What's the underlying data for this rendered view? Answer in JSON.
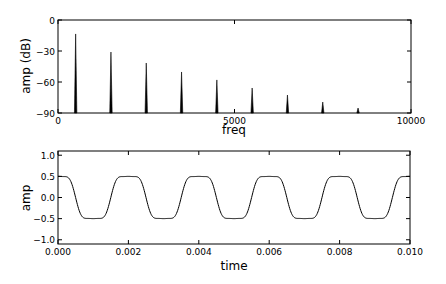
{
  "chart_data": [
    {
      "type": "bar",
      "subtype": "spectrum-stems",
      "title": "",
      "xlabel": "freq",
      "ylabel": "amp (dB)",
      "xlim": [
        0,
        10000
      ],
      "ylim": [
        -90,
        0
      ],
      "xticks": [
        0,
        5000,
        10000
      ],
      "xtick_labels": [
        "0",
        "5000",
        "10000"
      ],
      "yticks": [
        0,
        -30,
        -60,
        -90
      ],
      "ytick_labels": [
        "0",
        "−30",
        "−60",
        "−90"
      ],
      "grid": false,
      "legend": null,
      "x": [
        500,
        1500,
        2500,
        3500,
        4500,
        5500,
        6500,
        7500,
        8500
      ],
      "values": [
        -13.5,
        -31,
        -41.6,
        -50.3,
        -58,
        -65.8,
        -72.6,
        -79.4,
        -85.2
      ],
      "line_color": "#000000"
    },
    {
      "type": "line",
      "title": "",
      "xlabel": "time",
      "ylabel": "amp",
      "xlim": [
        0,
        0.01
      ],
      "ylim": [
        -1.1,
        1.1
      ],
      "xticks": [
        0,
        0.002,
        0.004,
        0.006,
        0.008,
        0.01
      ],
      "xtick_labels": [
        "0.000",
        "0.002",
        "0.004",
        "0.006",
        "0.008",
        "0.010"
      ],
      "yticks": [
        1.0,
        0.5,
        0.0,
        -0.5,
        -1.0
      ],
      "ytick_labels": [
        "1.0",
        "0.5",
        "0.0",
        "−0.5",
        "−1.0"
      ],
      "grid": false,
      "legend": null,
      "series": [
        {
          "name": "waveform",
          "description": "500 Hz smoothed square-like wave, amplitude ~0.5, peak at t=0",
          "frequency_hz": 500,
          "amplitude": 0.5,
          "x": [
            0,
            0.0005,
            0.001,
            0.0015,
            0.002,
            0.0025,
            0.003,
            0.0035,
            0.004,
            0.0045,
            0.005,
            0.0055,
            0.006,
            0.0065,
            0.007,
            0.0075,
            0.008,
            0.0085,
            0.009,
            0.0095,
            0.01
          ],
          "values": [
            0.5,
            0.0,
            -0.5,
            0.0,
            0.5,
            0.0,
            -0.5,
            0.0,
            0.5,
            0.0,
            -0.5,
            0.0,
            0.5,
            0.0,
            -0.5,
            0.0,
            0.5,
            0.0,
            -0.5,
            0.0,
            0.5
          ],
          "color": "#000000"
        }
      ]
    }
  ]
}
